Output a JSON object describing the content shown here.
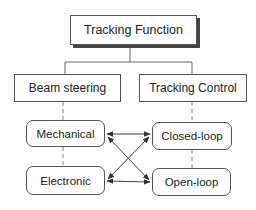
{
  "diagram": {
    "root": {
      "label": "Tracking Function"
    },
    "categories": [
      {
        "label": "Beam steering",
        "children": [
          {
            "label": "Mechanical"
          },
          {
            "label": "Electronic"
          }
        ]
      },
      {
        "label": "Tracking Control",
        "children": [
          {
            "label": "Closed-loop"
          },
          {
            "label": "Open-loop"
          }
        ]
      }
    ],
    "connections": [
      {
        "from": "Mechanical",
        "to": "Closed-loop",
        "type": "bidirectional"
      },
      {
        "from": "Mechanical",
        "to": "Open-loop",
        "type": "bidirectional"
      },
      {
        "from": "Electronic",
        "to": "Closed-loop",
        "type": "bidirectional"
      },
      {
        "from": "Electronic",
        "to": "Open-loop",
        "type": "bidirectional"
      }
    ],
    "colors": {
      "line": "#555555",
      "background": "#ffffff",
      "text": "#222222"
    }
  }
}
